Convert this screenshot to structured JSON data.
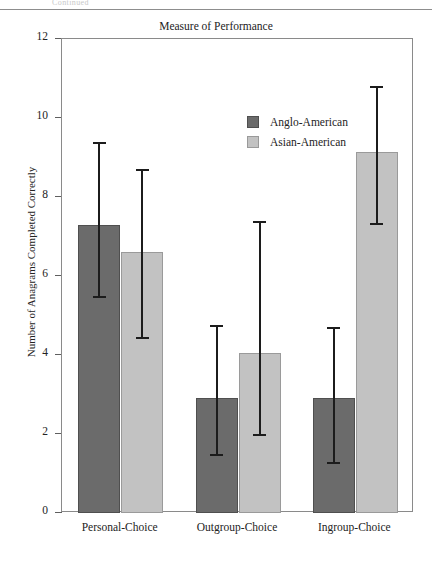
{
  "page": {
    "header_text": "Continued"
  },
  "figure": {
    "title": "Measure of Performance"
  },
  "legend": {
    "position": "inside-top-center",
    "entries": [
      {
        "label": "Anglo-American",
        "color": "#6b6b6b",
        "icon": "legend-swatch-icon"
      },
      {
        "label": "Asian-American",
        "color": "#c2c2c2",
        "icon": "legend-swatch-icon"
      }
    ]
  },
  "chart_data": {
    "type": "bar",
    "title": "Measure of Performance",
    "xlabel": "",
    "ylabel": "Number of Anagrams Completed Correctly",
    "categories": [
      "Personal-Choice",
      "Outgroup-Choice",
      "Ingroup-Choice"
    ],
    "ylim": [
      0,
      12
    ],
    "yticks": [
      0,
      2,
      4,
      6,
      8,
      10,
      12
    ],
    "ytick_labels": [
      "0",
      "2",
      "4",
      "6",
      "8",
      "10",
      "12"
    ],
    "grid": false,
    "error_bars": true,
    "series": [
      {
        "name": "Anglo-American",
        "color": "#6b6b6b",
        "values": [
          7.3,
          2.9,
          2.9
        ],
        "err_low": [
          5.5,
          1.5,
          1.3
        ],
        "err_high": [
          9.4,
          4.75,
          4.7
        ]
      },
      {
        "name": "Asian-American",
        "color": "#c2c2c2",
        "values": [
          6.6,
          4.05,
          9.15
        ],
        "err_low": [
          4.45,
          2.0,
          7.35
        ],
        "err_high": [
          8.7,
          7.4,
          10.8
        ]
      }
    ]
  }
}
